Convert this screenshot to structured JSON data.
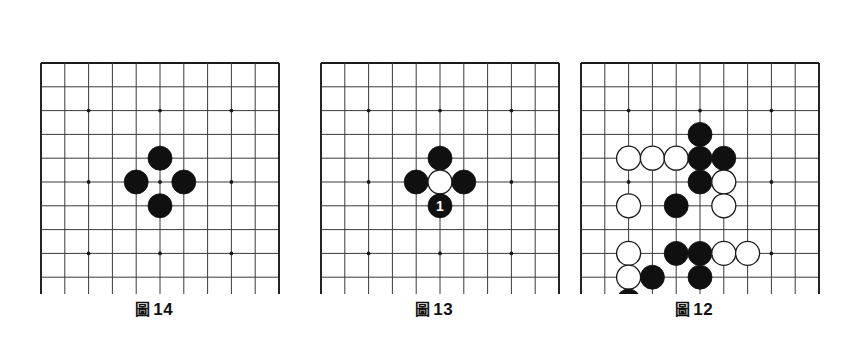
{
  "page": {
    "background_color": "#ffffff"
  },
  "board": {
    "line_count": 11,
    "cell_count": 10,
    "spacing_px": 23.8,
    "origin_x": 17,
    "origin_y": 10,
    "grid_color": "#3a3a3a",
    "border_color": "#1a1a1a",
    "star_point_color": "#1a1a1a",
    "star_points": [
      [
        2,
        2
      ],
      [
        5,
        2
      ],
      [
        8,
        2
      ],
      [
        2,
        5
      ],
      [
        5,
        5
      ],
      [
        8,
        5
      ],
      [
        2,
        8
      ],
      [
        5,
        8
      ],
      [
        8,
        8
      ]
    ],
    "black_color": "#101010",
    "white_color": "#ffffff",
    "white_outline_color": "#1a1a1a",
    "stone_radius": 12
  },
  "figures": [
    {
      "id": "figure-14",
      "caption_kanji": "圖",
      "caption_number": "14",
      "caption_text": "圖 14",
      "stones": [
        {
          "col": 5,
          "row": 4,
          "color": "black",
          "label": ""
        },
        {
          "col": 4,
          "row": 5,
          "color": "black",
          "label": ""
        },
        {
          "col": 6,
          "row": 5,
          "color": "black",
          "label": ""
        },
        {
          "col": 5,
          "row": 6,
          "color": "black",
          "label": ""
        }
      ]
    },
    {
      "id": "figure-13",
      "caption_kanji": "圖",
      "caption_number": "13",
      "caption_text": "圖 13",
      "stones": [
        {
          "col": 5,
          "row": 4,
          "color": "black",
          "label": ""
        },
        {
          "col": 4,
          "row": 5,
          "color": "black",
          "label": ""
        },
        {
          "col": 5,
          "row": 5,
          "color": "white",
          "label": ""
        },
        {
          "col": 6,
          "row": 5,
          "color": "black",
          "label": ""
        },
        {
          "col": 5,
          "row": 6,
          "color": "black",
          "label": "1"
        }
      ]
    },
    {
      "id": "figure-12",
      "caption_kanji": "圖",
      "caption_number": "12",
      "caption_text": "圖 12",
      "stones": [
        {
          "col": 5,
          "row": 3,
          "color": "black",
          "label": ""
        },
        {
          "col": 2,
          "row": 4,
          "color": "white",
          "label": ""
        },
        {
          "col": 3,
          "row": 4,
          "color": "white",
          "label": ""
        },
        {
          "col": 4,
          "row": 4,
          "color": "white",
          "label": ""
        },
        {
          "col": 5,
          "row": 4,
          "color": "black",
          "label": ""
        },
        {
          "col": 6,
          "row": 4,
          "color": "black",
          "label": ""
        },
        {
          "col": 5,
          "row": 5,
          "color": "black",
          "label": ""
        },
        {
          "col": 6,
          "row": 5,
          "color": "white",
          "label": ""
        },
        {
          "col": 2,
          "row": 6,
          "color": "white",
          "label": ""
        },
        {
          "col": 4,
          "row": 6,
          "color": "black",
          "label": ""
        },
        {
          "col": 6,
          "row": 6,
          "color": "white",
          "label": ""
        },
        {
          "col": 2,
          "row": 8,
          "color": "white",
          "label": ""
        },
        {
          "col": 4,
          "row": 8,
          "color": "black",
          "label": ""
        },
        {
          "col": 5,
          "row": 8,
          "color": "black",
          "label": ""
        },
        {
          "col": 6,
          "row": 8,
          "color": "white",
          "label": ""
        },
        {
          "col": 7,
          "row": 8,
          "color": "white",
          "label": ""
        },
        {
          "col": 2,
          "row": 9,
          "color": "white",
          "label": ""
        },
        {
          "col": 3,
          "row": 9,
          "color": "black",
          "label": ""
        },
        {
          "col": 5,
          "row": 9,
          "color": "black",
          "label": ""
        },
        {
          "col": 2,
          "row": 10,
          "color": "black",
          "label": ""
        }
      ]
    }
  ]
}
